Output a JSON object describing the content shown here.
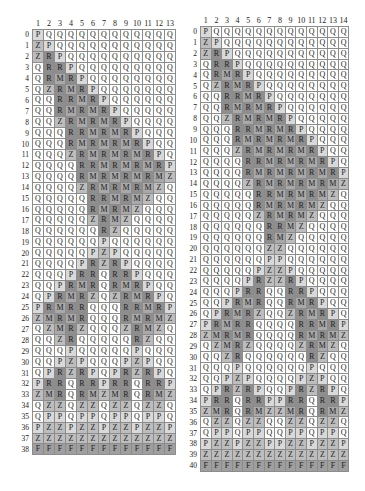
{
  "legend_colors": {
    "Q": "#ffffff",
    "P": "#d9d9d9",
    "Z": "#bdbdbd",
    "M": "#a9a9a9",
    "R": "#8e8e8e",
    "F": "#9f9f9f"
  },
  "left_grid": {
    "columns": [
      "1",
      "2",
      "3",
      "4",
      "5",
      "6",
      "7",
      "8",
      "9",
      "10",
      "11",
      "12",
      "13"
    ],
    "rows": [
      "PQQQQQQQQQQQQ",
      "ZPQQQQQQQQQQQ",
      "ZRPQQQQQQQQQQ",
      "QRRPQQQQQQQQQ",
      "QRMRPQQQQQQQQ",
      "QZRMRPQQQQQQQ",
      "QQRRMRPQQQQQQ",
      "QQRMRMRPQQQQQ",
      "QQZRMRMRPQQQQ",
      "QQQRRMRMRPQQQ",
      "QQQRMRMRMRPQQ",
      "QQQZRMRMRMRPQ",
      "QQQQRRMRMRMRP",
      "QQQQRMRMRMRMZ",
      "QQQQZRMRMRMZQ",
      "QQQQQRRMRMZQQ",
      "QQQQQRMRMZQQQ",
      "QQQQQZRMZQQQQ",
      "QQQQQQRZQQQQQ",
      "QQQQQQPQQQQQQ",
      "QQQQQPZPQQQQQ",
      "QQQQPRZRPQQQQ",
      "QQQPRRQRRPQQQ",
      "QQPRMRQRMRPQQ",
      "QPRMRZQZRMRPQ",
      "PRMRRQQQRRMRP",
      "ZMRMRQQQRMRMZ",
      "QZMRZQQQZRMZQ",
      "QQZRQQQQQRZQQ",
      "QQQPQQQQQPQQQ",
      "QQPZPQQQPZPQQ",
      "QPRZRPQPRZRPQ",
      "PRRQRRPRRQRRP",
      "ZMRQRMZMRQRMZ",
      "QZZQZZQZZQZZQ",
      "QPPQPPQPPQPPQ",
      "PZZPZZPZZPZZP",
      "ZZZZZZZZZZZZZ",
      "FFFFFFFFFFFFF"
    ]
  },
  "right_grid": {
    "columns": [
      "1",
      "2",
      "3",
      "4",
      "5",
      "6",
      "7",
      "8",
      "9",
      "10",
      "11",
      "12",
      "13",
      "14"
    ],
    "rows": [
      "PQQQQQQQQQQQQQ",
      "ZPQQQQQQQQQQQQ",
      "ZRPQQQQQQQQQQQ",
      "QRRPQQQQQQQQQQ",
      "QRMRPQQQQQQQQQ",
      "QZRMRPQQQQQQQQ",
      "QQRRMRPQQQQQQQ",
      "QQRMRMRPQQQQQQ",
      "QQZRMRMRPQQQQQ",
      "QQQRRMRMRPQQQQ",
      "QQQRMRMRMRPQQQ",
      "QQQZRMRMRMRPQQ",
      "QQQQRRMRMRMRPQ",
      "QQQQRMRMRMRMRP",
      "QQQQZRMRMRMRMZ",
      "QQQQQRRMRMRMZQ",
      "QQQQQRMRMRMZQQ",
      "QQQQQZRMRMZQQQ",
      "QQQQQQRRMZQQQQ",
      "QQQQQQRMZQQQQQ",
      "QQQQQQZZQQQQQQ",
      "QQQQQQPPQQQQQQ",
      "QQQQQPZZPQQQQQ",
      "QQQQPRZZRPQQQQ",
      "QQQPRRQQRRPQQQ",
      "QQPRMRQQRMRPQQ",
      "QPRMRZQQZRMRPQ",
      "PRMRRQQQQRRMRP",
      "ZMRMRQQQQRMRMZ",
      "QZMRZQQQQZRMZQ",
      "QQZRQQQQQQRZQQ",
      "QQQPQQQQQQPQQQ",
      "QQPZPQQQQPZPQQ",
      "QPRZRPQQPRZRPQ",
      "PRRQRRPPRRQRRP",
      "ZMRQRMZZMRQRMZ",
      "QZZQZZQQZZQZZQ",
      "QPPQPPQQPPQPPQ",
      "PZZPZZPPZZPZZP",
      "ZZZZZZZZZZZZZZ",
      "FFFFFFFFFFFFFF"
    ]
  }
}
